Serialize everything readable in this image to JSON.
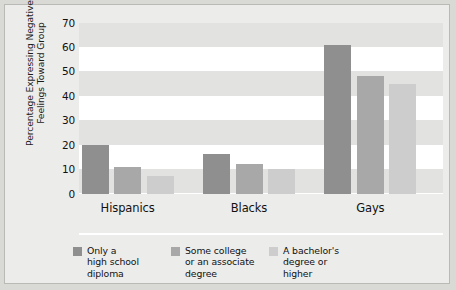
{
  "chart_data": {
    "type": "bar",
    "title": "",
    "xlabel": "",
    "ylabel": "Percentage Expressing Negative\nFeelings Toward Group",
    "ylabel_line1": "Percentage Expressing Negative",
    "ylabel_line2": "Feelings Toward Group",
    "categories": [
      "Hispanics",
      "Blacks",
      "Gays"
    ],
    "series": [
      {
        "name": "Only a high school diploma",
        "values": [
          20,
          16,
          61
        ],
        "color": "#8f8f8f"
      },
      {
        "name": "Some college or an associate degree",
        "values": [
          11,
          12,
          48
        ],
        "color": "#a8a8a8"
      },
      {
        "name": "A bachelor's degree or higher",
        "values": [
          7,
          10,
          45
        ],
        "color": "#cdcdcd"
      }
    ],
    "ylim": [
      0,
      70
    ],
    "yticks": [
      0,
      10,
      20,
      30,
      40,
      50,
      60,
      70
    ],
    "ytick_labels": [
      "0",
      "10",
      "20",
      "30",
      "40",
      "50",
      "60",
      "70"
    ],
    "grid": "horizontal-bands",
    "legend_position": "bottom"
  },
  "legend": {
    "items": [
      {
        "label": "Only a\nhigh school\ndiploma",
        "color": "#8f8f8f"
      },
      {
        "label": "Some college\nor an associate\ndegree",
        "color": "#a8a8a8"
      },
      {
        "label": "A bachelor's\ndegree or\nhigher",
        "color": "#cdcdcd"
      }
    ]
  },
  "colors": {
    "figure_background": "#ececeb",
    "plot_background": "#ffffff",
    "band": "#e2e2e0",
    "text": "#111111",
    "border": "#b9b9b5"
  }
}
